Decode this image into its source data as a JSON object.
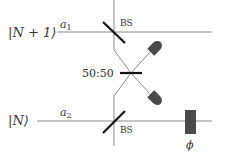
{
  "diagram": {
    "inputs": [
      {
        "state": "|N + 1⟩",
        "mode": "a",
        "mode_sub": "1"
      },
      {
        "state": "|N⟩",
        "mode": "a",
        "mode_sub": "2"
      }
    ],
    "components": {
      "bs_top_label": "BS",
      "bs_bottom_label": "BS",
      "bs_center_label": "50:50",
      "phase_label": "ϕ"
    },
    "detectors": [
      "detector-upper",
      "detector-lower"
    ],
    "colors": {
      "line": "#8a8a8a",
      "beamsplitter": "#111111",
      "detector": "#4a4a4a",
      "phase_shifter": "#4a4a4a",
      "text": "#333333"
    }
  }
}
